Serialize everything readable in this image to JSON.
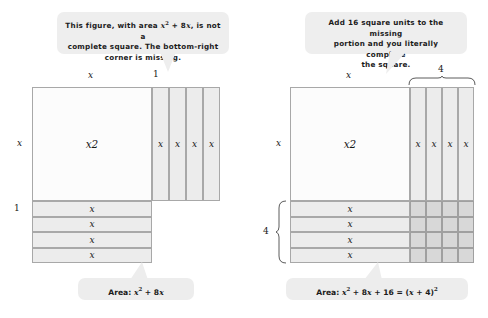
{
  "left_panel": {
    "callout": {
      "line1_pre": "This figure, with area ",
      "math1": "x",
      "sup1": "2",
      "line1_mid": " + 8",
      "math2": "x",
      "line1_post": ", is not a",
      "line2": "complete square. The bottom-right",
      "line3": "corner is missing."
    },
    "top_label_x": "x",
    "top_label_one": "1",
    "side_label_x": "x",
    "side_label_one": "1",
    "square_label": "x",
    "square_label_sup": "2",
    "vertical_strips": [
      "x",
      "x",
      "x",
      "x"
    ],
    "horizontal_strips": [
      "x",
      "x",
      "x",
      "x"
    ],
    "area_pill": {
      "prefix": "Area:  ",
      "m1": "x",
      "sup1": "2",
      "mid": " + 8",
      "m2": "x"
    }
  },
  "right_panel": {
    "callout": {
      "line1": "Add 16 square units to the missing",
      "line2": "portion and you literally complete",
      "line3": "the square."
    },
    "top_label_x": "x",
    "top_brace_label": "4",
    "side_label_x": "x",
    "side_brace_label": "4",
    "square_label": "x",
    "square_label_sup": "2",
    "vertical_strips": [
      "x",
      "x",
      "x",
      "x"
    ],
    "horizontal_strips": [
      "x",
      "x",
      "x",
      "x"
    ],
    "filled_grid": {
      "rows": 4,
      "cols": 4
    },
    "area_pill": {
      "prefix": "Area:  ",
      "m1": "x",
      "sup1": "2",
      "t1": " + 8",
      "m2": "x",
      "t2": " + 16 = (",
      "m3": "x",
      "t3": " + 4)",
      "sup2": "2"
    }
  },
  "colors": {
    "callout_bg": "#eeeeee",
    "strip_fill": "#ececec",
    "square_fill": "#fcfcfc",
    "cell_fill": "#d8d8d8",
    "stroke": "#a8a8a8",
    "text": "#171717"
  }
}
